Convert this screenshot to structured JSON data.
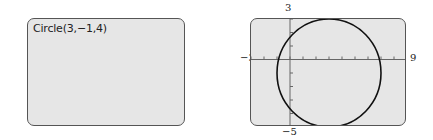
{
  "home_screen": {
    "command_text": "Circle(3,−1,4)"
  },
  "graph_screen": {
    "window": {
      "xmin": -3,
      "xmax": 9,
      "ymin": -5,
      "ymax": 3,
      "xscl": 1,
      "yscl": 1
    },
    "labels": {
      "xmin": "−3",
      "xmax": "9",
      "ymin": "−5",
      "ymax": "3"
    },
    "circle": {
      "center_x": 3,
      "center_y": -1,
      "radius": 4
    },
    "colors": {
      "screen_bg": "#e6e6e6",
      "border": "#555555",
      "curve": "#111111",
      "axis": "#666666"
    }
  }
}
